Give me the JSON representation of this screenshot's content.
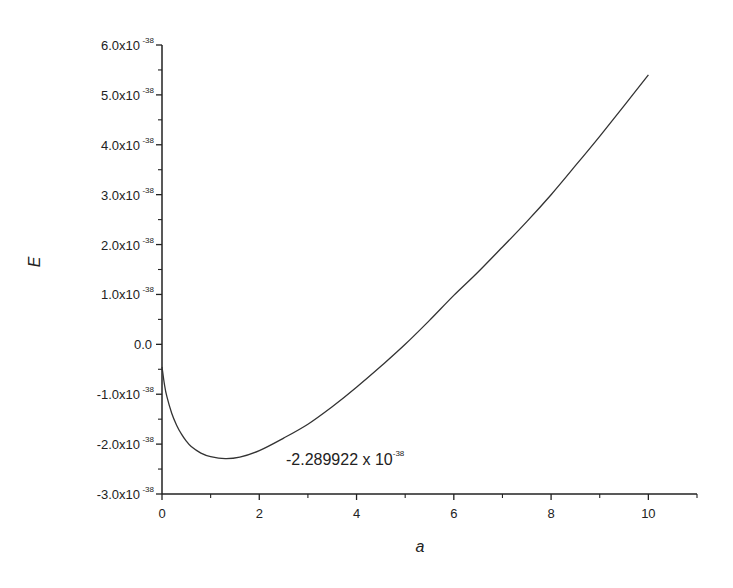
{
  "chart_data": {
    "type": "line",
    "title": "",
    "xlabel": "a",
    "ylabel": "E",
    "xlim": [
      0,
      11
    ],
    "ylim": [
      -3e-38,
      6e-38
    ],
    "y_scale_exponent": -38,
    "grid": false,
    "legend": null,
    "x_ticks": [
      0,
      2,
      4,
      6,
      8,
      10
    ],
    "x_minor_ticks": [
      1,
      3,
      5,
      7,
      9,
      11
    ],
    "y_ticks": [
      {
        "value": 6.0,
        "label": "6.0x10",
        "exp": "-38"
      },
      {
        "value": 5.0,
        "label": "5.0x10",
        "exp": "-38"
      },
      {
        "value": 4.0,
        "label": "4.0x10",
        "exp": "-38"
      },
      {
        "value": 3.0,
        "label": "3.0x10",
        "exp": "-38"
      },
      {
        "value": 2.0,
        "label": "2.0x10",
        "exp": "-38"
      },
      {
        "value": 1.0,
        "label": "1.0x10",
        "exp": "-38"
      },
      {
        "value": 0.0,
        "label": "0.0",
        "exp": ""
      },
      {
        "value": -1.0,
        "label": "-1.0x10",
        "exp": "-38"
      },
      {
        "value": -2.0,
        "label": "-2.0x10",
        "exp": "-38"
      },
      {
        "value": -3.0,
        "label": "-3.0x10",
        "exp": "-38"
      }
    ],
    "series": [
      {
        "name": "E(a)",
        "unit_multiplier": "1e-38",
        "x": [
          0.0,
          0.05,
          0.1,
          0.2,
          0.3,
          0.4,
          0.5,
          0.6,
          0.8,
          1.0,
          1.3,
          1.6,
          2.0,
          2.5,
          3.0,
          3.5,
          4.0,
          4.5,
          5.0,
          5.5,
          6.0,
          6.5,
          7.0,
          7.5,
          8.0,
          8.5,
          9.0,
          9.5,
          10.0
        ],
        "y": [
          -0.45,
          -0.8,
          -1.05,
          -1.38,
          -1.62,
          -1.8,
          -1.94,
          -2.05,
          -2.18,
          -2.25,
          -2.29,
          -2.26,
          -2.13,
          -1.88,
          -1.6,
          -1.25,
          -0.86,
          -0.44,
          0.0,
          0.48,
          0.98,
          1.45,
          1.95,
          2.46,
          3.0,
          3.58,
          4.17,
          4.78,
          5.4
        ]
      }
    ],
    "annotations": [
      {
        "text": "-2.289922 x 10",
        "exp": "-38",
        "x": 2.6,
        "y": -2.3
      }
    ]
  }
}
